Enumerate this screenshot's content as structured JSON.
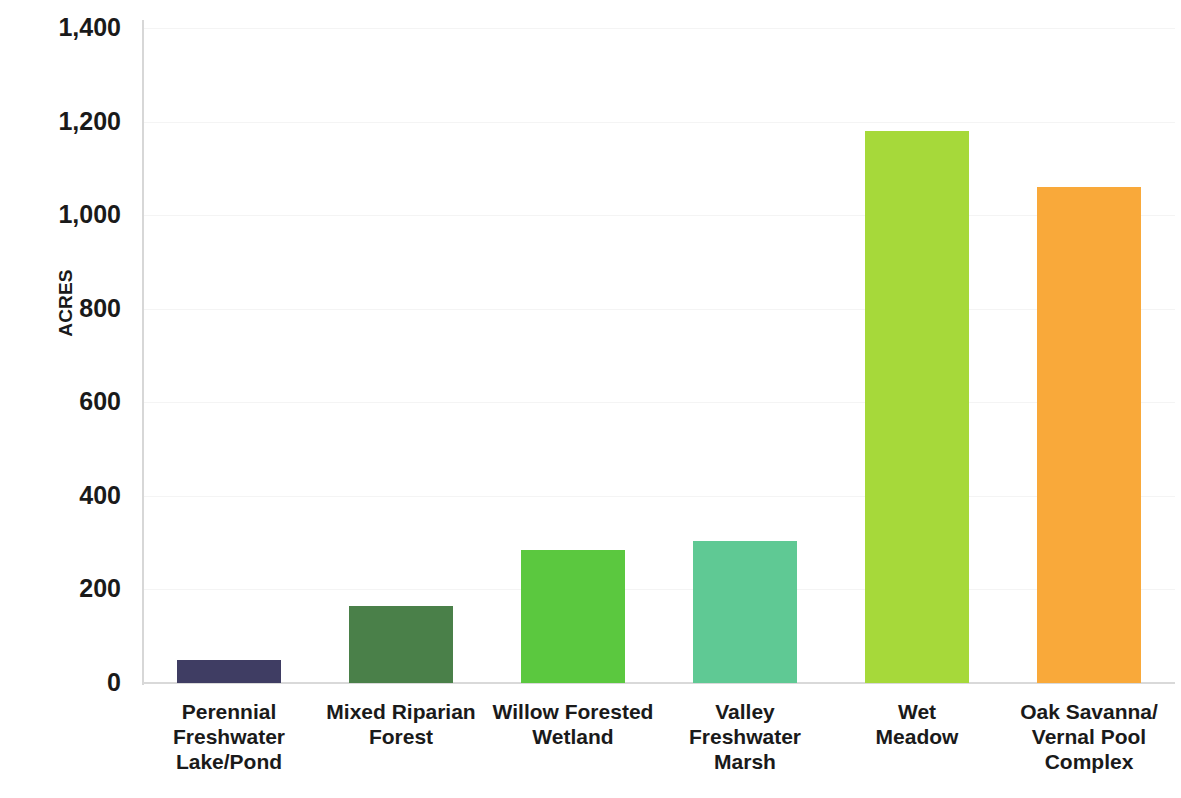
{
  "chart_data": {
    "type": "bar",
    "title": "",
    "xlabel": "",
    "ylabel": "ACRES",
    "ylim": [
      0,
      1400
    ],
    "grid": true,
    "legend": "none",
    "categories": [
      "Perennial Freshwater Lake/Pond",
      "Mixed Riparian Forest",
      "Willow Forested Wetland",
      "Valley Freshwater Marsh",
      "Wet Meadow",
      "Oak Savanna/Vernal Pool Complex"
    ],
    "values": [
      50,
      165,
      285,
      303,
      1180,
      1060
    ],
    "bar_colors": [
      "#3f3d63",
      "#4a8049",
      "#5bc83f",
      "#5fc994",
      "#a6d93a",
      "#f9a93a"
    ],
    "y_ticks": [
      0,
      200,
      400,
      600,
      800,
      1000,
      1200,
      1400
    ],
    "y_tick_labels": [
      "0",
      "200",
      "400",
      "600",
      "800",
      "1,000",
      "1,200",
      "1,400"
    ]
  },
  "axis": {
    "y_title": "ACRES"
  },
  "categories_display": [
    [
      "Perennial",
      "Freshwater",
      "Lake/Pond"
    ],
    [
      "Mixed Riparian",
      "Forest"
    ],
    [
      "Willow Forested",
      "Wetland"
    ],
    [
      "Valley",
      "Freshwater",
      "Marsh"
    ],
    [
      "Wet",
      "Meadow"
    ],
    [
      "Oak Savanna/",
      "Vernal Pool",
      "Complex"
    ]
  ]
}
